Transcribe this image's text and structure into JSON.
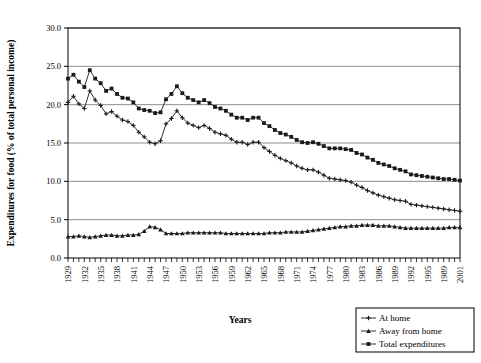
{
  "chart_data": {
    "type": "line",
    "title": "",
    "xlabel": "Years",
    "ylabel": "Expenditures for food (% of total personal income)",
    "ylim": [
      0.0,
      30.0
    ],
    "yticks": [
      "0.0",
      "5.0",
      "10.0",
      "15.0",
      "20.0",
      "25.0",
      "30.0"
    ],
    "ytick_values": [
      0.0,
      5.0,
      10.0,
      15.0,
      20.0,
      25.0,
      30.0
    ],
    "grid": true,
    "legend_position": "bottom-right",
    "xlim": [
      1929,
      2001
    ],
    "xtick_labels": [
      "1929",
      "1932",
      "1935",
      "1938",
      "1941",
      "1944",
      "1947",
      "1950",
      "1953",
      "1956",
      "1959",
      "1962",
      "1965",
      "1968",
      "1971",
      "1974",
      "1977",
      "1980",
      "1983",
      "1986",
      "1989",
      "1992",
      "1995",
      "1989",
      "2001"
    ],
    "x": [
      1929,
      1930,
      1931,
      1932,
      1933,
      1934,
      1935,
      1936,
      1937,
      1938,
      1939,
      1940,
      1941,
      1942,
      1943,
      1944,
      1945,
      1946,
      1947,
      1948,
      1949,
      1950,
      1951,
      1952,
      1953,
      1954,
      1955,
      1956,
      1957,
      1958,
      1959,
      1960,
      1961,
      1962,
      1963,
      1964,
      1965,
      1966,
      1967,
      1968,
      1969,
      1970,
      1971,
      1972,
      1973,
      1974,
      1975,
      1976,
      1977,
      1978,
      1979,
      1980,
      1981,
      1982,
      1983,
      1984,
      1985,
      1986,
      1987,
      1988,
      1989,
      1990,
      1991,
      1992,
      1993,
      1994,
      1995,
      1996,
      1997,
      1998,
      1999,
      2000,
      2001
    ],
    "series": [
      {
        "name": "At home",
        "marker": "cross",
        "values": [
          20.3,
          21.1,
          20.1,
          19.5,
          21.8,
          20.6,
          19.9,
          18.8,
          19.1,
          18.5,
          18.0,
          17.8,
          17.3,
          16.4,
          15.8,
          15.1,
          14.9,
          15.3,
          17.5,
          18.2,
          19.2,
          18.3,
          17.6,
          17.3,
          17.0,
          17.3,
          16.9,
          16.4,
          16.2,
          16.0,
          15.5,
          15.1,
          15.1,
          14.8,
          15.1,
          15.1,
          14.4,
          13.9,
          13.4,
          13.0,
          12.7,
          12.4,
          12.0,
          11.7,
          11.5,
          11.5,
          11.2,
          10.8,
          10.4,
          10.3,
          10.2,
          10.1,
          9.9,
          9.5,
          9.2,
          8.8,
          8.5,
          8.2,
          8.0,
          7.8,
          7.6,
          7.5,
          7.4,
          7.0,
          6.9,
          6.8,
          6.7,
          6.6,
          6.5,
          6.4,
          6.3,
          6.2,
          6.1
        ]
      },
      {
        "name": "Away from home",
        "marker": "triangle",
        "values": [
          2.8,
          2.8,
          2.9,
          2.8,
          2.7,
          2.8,
          2.9,
          3.0,
          3.0,
          2.9,
          2.9,
          3.0,
          3.0,
          3.1,
          3.5,
          4.1,
          4.0,
          3.7,
          3.2,
          3.2,
          3.2,
          3.2,
          3.3,
          3.3,
          3.3,
          3.3,
          3.3,
          3.3,
          3.3,
          3.2,
          3.2,
          3.2,
          3.2,
          3.2,
          3.2,
          3.2,
          3.2,
          3.3,
          3.3,
          3.3,
          3.4,
          3.4,
          3.4,
          3.4,
          3.5,
          3.6,
          3.7,
          3.8,
          3.9,
          4.0,
          4.1,
          4.1,
          4.2,
          4.2,
          4.3,
          4.3,
          4.3,
          4.2,
          4.2,
          4.2,
          4.1,
          4.0,
          3.9,
          3.9,
          3.9,
          3.9,
          3.9,
          3.9,
          3.9,
          3.9,
          4.0,
          4.0,
          4.0
        ]
      },
      {
        "name": "Total expenditures",
        "marker": "square",
        "values": [
          23.4,
          23.9,
          23.0,
          22.3,
          24.5,
          23.4,
          22.8,
          21.8,
          22.1,
          21.4,
          20.9,
          20.8,
          20.3,
          19.5,
          19.3,
          19.2,
          18.9,
          19.0,
          20.7,
          21.4,
          22.4,
          21.5,
          20.9,
          20.6,
          20.3,
          20.6,
          20.2,
          19.7,
          19.5,
          19.2,
          18.7,
          18.3,
          18.3,
          18.0,
          18.3,
          18.3,
          17.6,
          17.2,
          16.7,
          16.3,
          16.1,
          15.8,
          15.4,
          15.1,
          15.0,
          15.1,
          14.9,
          14.6,
          14.3,
          14.3,
          14.3,
          14.2,
          14.1,
          13.7,
          13.5,
          13.1,
          12.8,
          12.4,
          12.2,
          12.0,
          11.7,
          11.5,
          11.3,
          10.9,
          10.8,
          10.7,
          10.6,
          10.5,
          10.4,
          10.3,
          10.3,
          10.2,
          10.1
        ]
      }
    ]
  },
  "legend": {
    "items": [
      {
        "label": "At home",
        "marker": "cross"
      },
      {
        "label": "Away from home",
        "marker": "triangle"
      },
      {
        "label": "Total expenditures",
        "marker": "square"
      }
    ]
  },
  "colors": {
    "line": "#1a1a1a",
    "grid": "#808080",
    "axis": "#000000",
    "background": "#ffffff"
  }
}
